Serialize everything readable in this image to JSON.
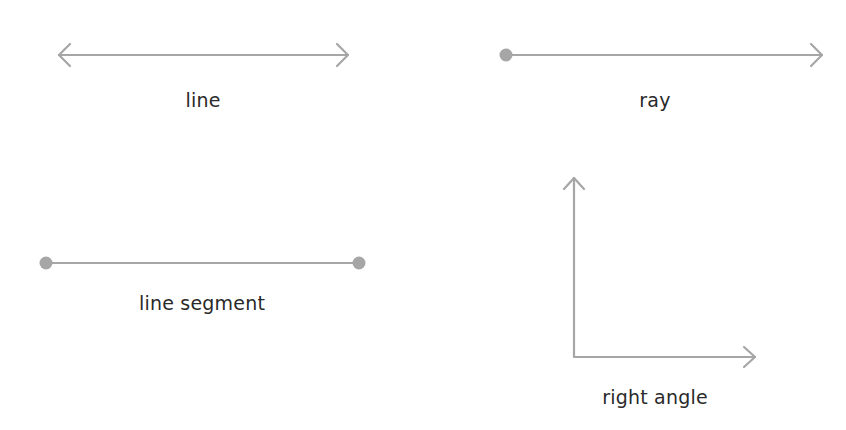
{
  "colors": {
    "stroke": "#a6a6a6",
    "point": "#a6a6a6",
    "text": "#2a2a2a",
    "background": "#ffffff"
  },
  "figures": [
    {
      "id": "line",
      "label": "line",
      "type": "line",
      "endpoints": "arrow-arrow"
    },
    {
      "id": "ray",
      "label": "ray",
      "type": "ray",
      "endpoints": "point-arrow"
    },
    {
      "id": "line-segment",
      "label": "line segment",
      "type": "segment",
      "endpoints": "point-point"
    },
    {
      "id": "right-angle",
      "label": "right angle",
      "type": "angle",
      "endpoints": "arrow-arrow"
    }
  ]
}
